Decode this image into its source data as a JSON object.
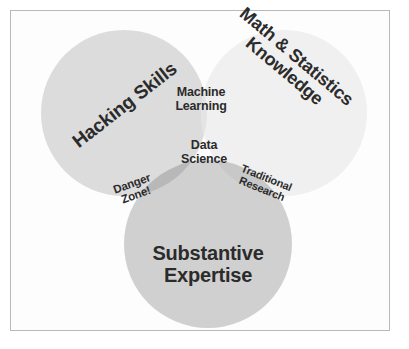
{
  "diagram": {
    "type": "venn",
    "set_count": 3,
    "background_color": "#ffffff",
    "frame_color": "#b9b9b9",
    "text_color": "#2b2b2b",
    "circles": [
      {
        "id": "hacking-skills",
        "label": "Hacking Skills",
        "cx": 124,
        "cy": 113,
        "r": 83,
        "fill": "#dcdcdc",
        "rotation_deg": -38
      },
      {
        "id": "math-statistics-knowledge",
        "label": "Math & Statistics\nKnowledge",
        "cx": 284,
        "cy": 113,
        "r": 83,
        "fill": "#f0f0f0",
        "rotation_deg": 40
      },
      {
        "id": "substantive-expertise",
        "label": "Substantive\nExpertise",
        "cx": 208,
        "cy": 244,
        "r": 84,
        "fill": "#d0d0d0",
        "rotation_deg": 0
      }
    ],
    "intersections": [
      {
        "id": "machine-learning",
        "label": "Machine\nLearning",
        "sets": [
          "hacking-skills",
          "math-statistics-knowledge"
        ],
        "fill": "#e4e4e4",
        "rotation_deg": 0
      },
      {
        "id": "danger-zone",
        "label": "Danger\nZone!",
        "sets": [
          "hacking-skills",
          "substantive-expertise"
        ],
        "fill": "#b8b8b8",
        "rotation_deg": -20
      },
      {
        "id": "traditional-research",
        "label": "Traditional\nResearch",
        "sets": [
          "math-statistics-knowledge",
          "substantive-expertise"
        ],
        "fill": "#c8c8c8",
        "rotation_deg": 22
      },
      {
        "id": "data-science",
        "label": "Data\nScience",
        "sets": [
          "hacking-skills",
          "math-statistics-knowledge",
          "substantive-expertise"
        ],
        "fill": "#bcbcbc",
        "rotation_deg": 0
      }
    ]
  },
  "labels": {
    "hacking_skills": "Hacking Skills",
    "math_statistics_knowledge": "Math & Statistics\nKnowledge",
    "machine_learning": "Machine\nLearning",
    "data_science": "Data\nScience",
    "danger_zone": "Danger\nZone!",
    "traditional_research": "Traditional\nResearch",
    "substantive_expertise": "Substantive\nExpertise"
  }
}
